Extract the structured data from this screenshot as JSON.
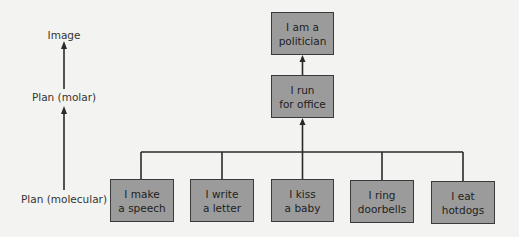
{
  "levels": {
    "image": "Image",
    "plan_molar": "Plan (molar)",
    "plan_molecular": "Plan (molecular)"
  },
  "hierarchy": {
    "image_node": "I am a\npolitician",
    "molar_node": "I run\nfor office",
    "molecular_nodes": [
      "I make\na speech",
      "I write\na letter",
      "I kiss\na baby",
      "I ring\ndoorbells",
      "I eat\nhotdogs"
    ]
  },
  "colors": {
    "box_fill": "#9b9b9b",
    "line": "#2a2a2a",
    "background": "#f3f3f1"
  }
}
